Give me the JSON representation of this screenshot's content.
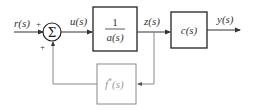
{
  "diagram": {
    "type": "control-block-diagram",
    "signals": {
      "input": "r(s)",
      "control": "u(s)",
      "intermediate": "z(s)",
      "output": "y(s)"
    },
    "summing_junction": {
      "symbol": "Σ",
      "signs": {
        "top_input": "+",
        "bottom_input": "+"
      }
    },
    "blocks": {
      "plant": {
        "numerator": "1",
        "denominator": "a(s)"
      },
      "output_block": {
        "label": "c(s)"
      },
      "feedback": {
        "label": "f*(s)",
        "base": "f",
        "superscript": "*",
        "argument": "(s)"
      }
    },
    "colors": {
      "main": "#222222",
      "feedback": "#888888"
    }
  }
}
